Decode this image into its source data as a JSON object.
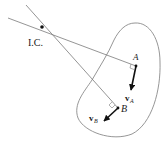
{
  "diagram": {
    "labels": {
      "ic": "I.C.",
      "point_a": "A",
      "point_b": "B",
      "velocity_a_v": "v",
      "velocity_a_sub": "A",
      "velocity_b_v": "v",
      "velocity_b_sub": "B"
    },
    "colors": {
      "line": "#7a7a7a",
      "outline": "#8a8a8a",
      "arrow": "#111111",
      "text": "#1a1a1a"
    }
  }
}
